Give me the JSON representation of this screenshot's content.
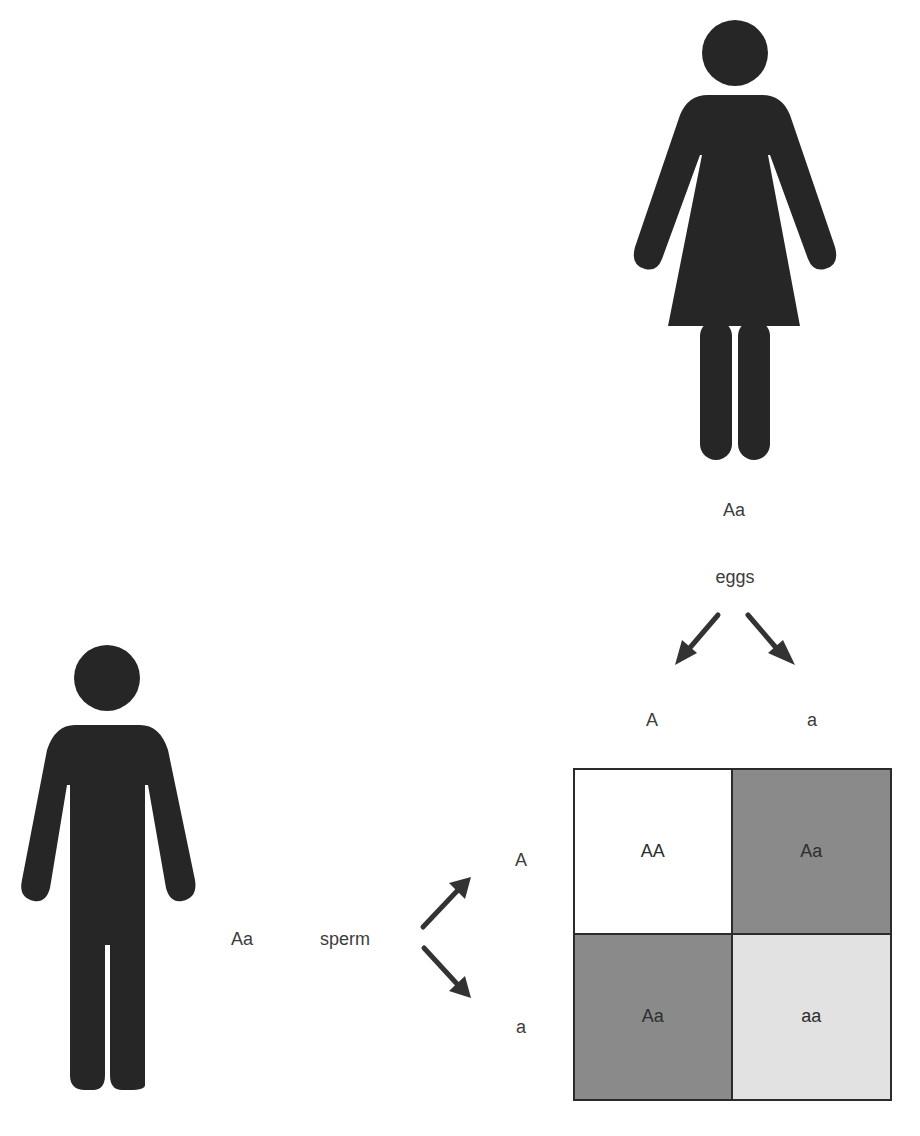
{
  "female": {
    "genotype": "Aa",
    "gamete_label": "eggs",
    "alleles": [
      "A",
      "a"
    ]
  },
  "male": {
    "genotype": "Aa",
    "gamete_label": "sperm",
    "alleles": [
      "A",
      "a"
    ]
  },
  "punnett": {
    "cells": [
      {
        "genotype": "AA",
        "color": "#ffffff"
      },
      {
        "genotype": "Aa",
        "color": "#8a8a8a"
      },
      {
        "genotype": "Aa",
        "color": "#8a8a8a"
      },
      {
        "genotype": "aa",
        "color": "#e2e2e2"
      }
    ]
  },
  "colors": {
    "figure": "#262626",
    "arrow": "#333333",
    "grid_border": "#2b2b2b"
  }
}
